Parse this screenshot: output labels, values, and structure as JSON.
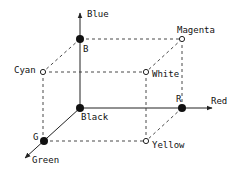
{
  "diagram": {
    "type": "rgb-color-cube",
    "axes": {
      "blue": {
        "label": "Blue"
      },
      "red": {
        "label": "Red"
      },
      "green": {
        "label": "Green"
      }
    },
    "vertices": {
      "black": {
        "label": "Black",
        "marker": "filled"
      },
      "blue": {
        "label": "B",
        "marker": "filled"
      },
      "red": {
        "label": "R",
        "marker": "filled"
      },
      "green": {
        "label": "G",
        "marker": "filled"
      },
      "cyan": {
        "label": "Cyan",
        "marker": "open"
      },
      "magenta": {
        "label": "Magenta",
        "marker": "open"
      },
      "yellow": {
        "label": "Yellow",
        "marker": "open"
      },
      "white": {
        "label": "White",
        "marker": "open"
      }
    },
    "colors": {
      "line": "#222222",
      "background": "#ffffff"
    }
  }
}
